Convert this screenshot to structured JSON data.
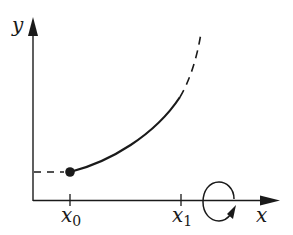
{
  "diagram": {
    "type": "solid-of-revolution-sketch",
    "axes": {
      "x_label": "x",
      "y_label": "y"
    },
    "ticks": [
      {
        "name": "x0",
        "base": "x",
        "subscript": "0"
      },
      {
        "name": "x1",
        "base": "x",
        "subscript": "1"
      }
    ],
    "curve": {
      "description": "increasing convex curve starting at filled point above x0, solid up to x1 then dashed beyond",
      "start_point": "filled dot at (x0, f(x0))",
      "solid_segment": "x0 to x1",
      "dashed_segment": "beyond x1"
    },
    "guide": {
      "description": "horizontal dashed line from y-axis to the starting dot"
    },
    "rotation_marker": {
      "description": "circular arrow around the x-axis indicating revolution about the x-axis"
    },
    "colors": {
      "stroke": "#1a1a1a",
      "background": "#ffffff"
    }
  }
}
